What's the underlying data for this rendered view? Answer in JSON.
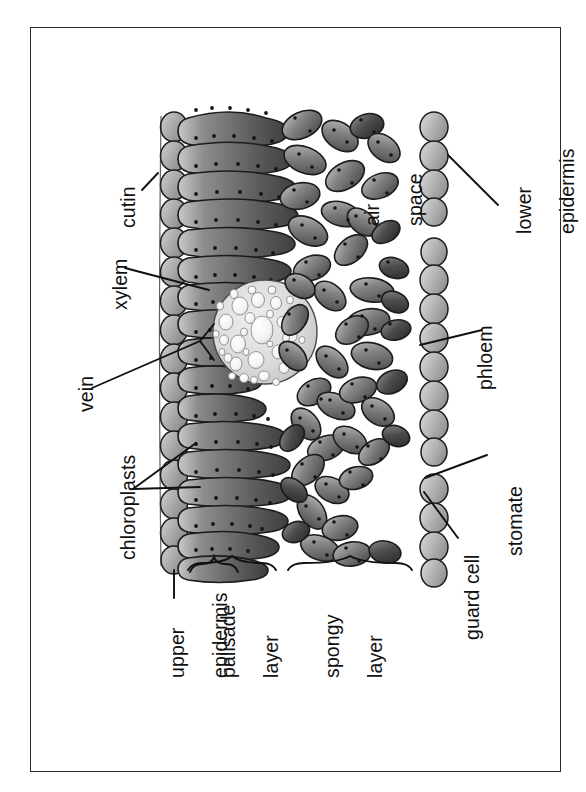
{
  "figure": {
    "orientation": "labels rotated 90 degrees counter-clockwise",
    "background_color": "#ffffff",
    "frame_color": "#2a2a2a",
    "ink_color": "#111111"
  },
  "labels": {
    "cutin": "cutin",
    "xylem": "xylem",
    "vein": "vein",
    "chloroplasts": "chloroplasts",
    "upper_epidermis_l1": "upper",
    "upper_epidermis_l2": "epidermis",
    "palisade_l1": "palisade",
    "palisade_l2": "layer",
    "spongy_l1": "spongy",
    "spongy_l2": "layer",
    "air_space_l1": "air",
    "air_space_l2": "space",
    "lower_epidermis_l1": "lower",
    "lower_epidermis_l2": "epidermis",
    "phloem": "phloem",
    "stomate": "stomate",
    "guard_cell": "guard cell"
  },
  "structures": {
    "upper_epidermis": {
      "name": "upper epidermis",
      "cells": 15,
      "fill": "#9a9a9a"
    },
    "palisade_layer": {
      "name": "palisade layer",
      "cells": 17,
      "fill": "#6e6e6e"
    },
    "spongy_layer": {
      "name": "spongy layer",
      "cells": 46,
      "fill": "#7d7d7d"
    },
    "lower_epidermis": {
      "name": "lower epidermis",
      "cells": 16,
      "fill": "#a6a6a6"
    },
    "vein_bundle": {
      "name": "vein",
      "fill": "#d8d8d8",
      "vessel_count": 52
    },
    "stomate": {
      "name": "stomate",
      "type": "pore-gap"
    },
    "guard_cells": {
      "name": "guard cell",
      "count": 2
    },
    "air_space": {
      "name": "air space",
      "fill": "#ffffff"
    },
    "chloroplasts": {
      "name": "chloroplasts",
      "render": "dark dots on cell margins"
    }
  },
  "braces": [
    {
      "name": "palisade-layer-brace"
    },
    {
      "name": "spongy-layer-brace"
    }
  ]
}
